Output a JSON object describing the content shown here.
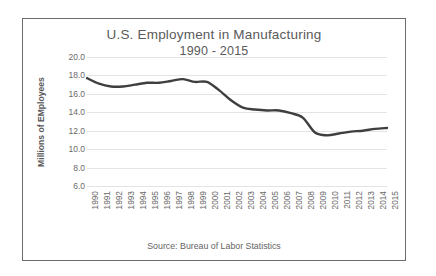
{
  "chart_data": {
    "type": "line",
    "title": "U.S. Employment in Manufacturing",
    "subtitle": "1990 - 2015",
    "xlabel": "",
    "ylabel": "Millions of EMployees",
    "source_note": "Source: Bureau of Labor Statistics",
    "grid": true,
    "legend": "none",
    "ylim": [
      6.0,
      20.0
    ],
    "yticks": [
      "20.0",
      "18.0",
      "16.0",
      "14.0",
      "12.0",
      "10.0",
      "8.0",
      "6.0"
    ],
    "ytick_values": [
      20.0,
      18.0,
      16.0,
      14.0,
      12.0,
      10.0,
      8.0,
      6.0
    ],
    "categories": [
      "1990",
      "1991",
      "1992",
      "1993",
      "1994",
      "1995",
      "1996",
      "1997",
      "1998",
      "1999",
      "2000",
      "2001",
      "2002",
      "2003",
      "2004",
      "2005",
      "2006",
      "2007",
      "2008",
      "2009",
      "2010",
      "2011",
      "2012",
      "2013",
      "2014",
      "2015"
    ],
    "series": [
      {
        "name": "Manufacturing employment",
        "color": "#3f3f3f",
        "values": [
          17.7,
          17.1,
          16.8,
          16.8,
          17.0,
          17.2,
          17.2,
          17.4,
          17.6,
          17.3,
          17.3,
          16.4,
          15.3,
          14.5,
          14.3,
          14.2,
          14.2,
          13.9,
          13.4,
          11.8,
          11.5,
          11.7,
          11.9,
          12.0,
          12.2,
          12.3
        ]
      }
    ]
  }
}
